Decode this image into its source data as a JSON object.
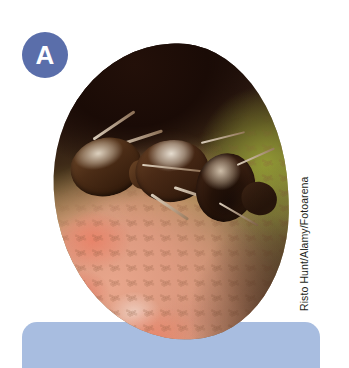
{
  "figure": {
    "panel_letter": "A",
    "badge_color": "#5a6eaa",
    "badge_text_color": "#ffffff",
    "photo_credit": "Risto Hunt/Alamy/Fotoarena",
    "caption_panel_color": "#a8bde0",
    "caption_text": "",
    "photo": {
      "alt": "Close-up macro photograph of a brown ant standing on a pinkish speckled fruit or flower bud against a dark background",
      "subject": "ant",
      "background_colors": [
        "#1a0b06",
        "#8a8a3f",
        "#e8a68c"
      ],
      "shape": "organic-blob"
    }
  }
}
